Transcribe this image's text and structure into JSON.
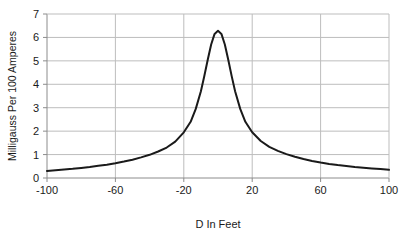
{
  "chart_data": {
    "type": "line",
    "title": "",
    "subtitle": "",
    "xlabel": "D   In Feet",
    "ylabel": "Milligauss Per 100 Amperes",
    "xlim": [
      -100,
      100
    ],
    "ylim": [
      0,
      7
    ],
    "xticks": [
      "-100",
      "-60",
      "-20",
      "20",
      "60",
      "100"
    ],
    "xtick_values": [
      -100,
      -60,
      -20,
      20,
      60,
      100
    ],
    "yticks": [
      "0",
      "1",
      "2",
      "3",
      "4",
      "5",
      "6",
      "7"
    ],
    "ytick_values": [
      0,
      1,
      2,
      3,
      4,
      5,
      6,
      7
    ],
    "grid": "both",
    "legend": "none",
    "series": [
      {
        "name": "Milligauss vs Distance",
        "x": [
          -100,
          -95,
          -90,
          -85,
          -80,
          -75,
          -70,
          -65,
          -60,
          -55,
          -50,
          -45,
          -40,
          -35,
          -30,
          -25,
          -20,
          -16,
          -13,
          -10,
          -8,
          -6,
          -4,
          -2,
          0,
          2,
          4,
          6,
          8,
          10,
          13,
          16,
          20,
          25,
          30,
          35,
          40,
          45,
          50,
          55,
          60,
          65,
          70,
          75,
          80,
          85,
          90,
          95,
          100
        ],
        "y": [
          0.3,
          0.33,
          0.36,
          0.39,
          0.43,
          0.47,
          0.52,
          0.57,
          0.63,
          0.7,
          0.78,
          0.88,
          0.99,
          1.13,
          1.3,
          1.55,
          1.95,
          2.4,
          2.95,
          3.7,
          4.35,
          5.05,
          5.7,
          6.15,
          6.28,
          6.15,
          5.7,
          5.05,
          4.35,
          3.7,
          2.95,
          2.4,
          1.95,
          1.58,
          1.33,
          1.16,
          1.02,
          0.91,
          0.81,
          0.73,
          0.66,
          0.6,
          0.55,
          0.51,
          0.47,
          0.44,
          0.41,
          0.38,
          0.35
        ],
        "peak_x": 0,
        "peak_y": 6.3,
        "left_end_y": 0.3,
        "right_end_y": 0.35,
        "color": "#1a1a1a",
        "line_width": 2
      }
    ],
    "colors": {
      "line": "#1a1a1a",
      "grid": "#bdbdbd",
      "axis": "#8c8c8c",
      "text": "#1a1a1a",
      "background": "#ffffff"
    }
  }
}
